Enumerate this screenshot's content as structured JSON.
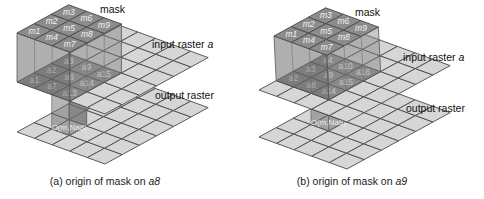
{
  "panels": [
    {
      "id": "a",
      "mask_label": "mask",
      "input_label": "input raster",
      "input_var": "a",
      "output_label": "output raster",
      "caption_prefix": "(a) origin of mask on ",
      "caption_var": "a8",
      "mask_cells": [
        "m1",
        "m2",
        "m3",
        "m4",
        "m5",
        "m6",
        "m7",
        "m8",
        "m9"
      ],
      "input_cells": [
        "a1",
        "a2",
        "a3",
        "a7",
        "a8",
        "a9",
        "a13",
        "a14",
        "a15"
      ],
      "output_cell_label": "O(m,Na8)"
    },
    {
      "id": "b",
      "mask_label": "mask",
      "input_label": "input raster",
      "input_var": "a",
      "output_label": "output raster",
      "caption_prefix": "(b) origin of mask on ",
      "caption_var": "a9",
      "mask_cells": [
        "m1",
        "m2",
        "m3",
        "m4",
        "m5",
        "m6",
        "m7",
        "m8",
        "m9"
      ],
      "input_cells": [
        "a2",
        "a3",
        "a4",
        "a8",
        "a9",
        "a10",
        "a14",
        "a15",
        "a16"
      ],
      "output_cell_label": "O(m,Na9)"
    }
  ],
  "colors": {
    "raster_cell": "#d6d6d6",
    "grid_line": "#4a4a4a",
    "mask": "#8c8c8c"
  }
}
